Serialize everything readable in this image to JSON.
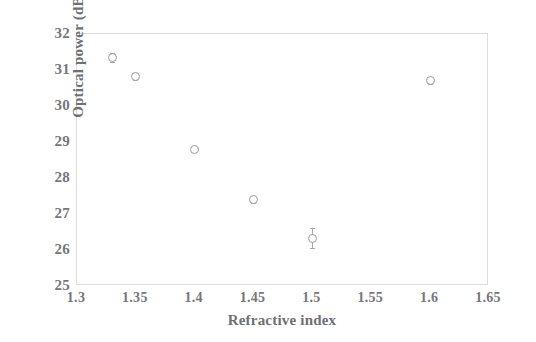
{
  "chart_data": {
    "type": "scatter",
    "title": "",
    "xlabel": "Refractive index",
    "ylabel": "Optical power (dB)",
    "xlim": [
      1.3,
      1.65
    ],
    "ylim": [
      25,
      32
    ],
    "grid": false,
    "legend": "none",
    "xticks": [
      "1.3",
      "1.35",
      "1.4",
      "1.45",
      "1.5",
      "1.55",
      "1.6",
      "1.65"
    ],
    "xtick_values": [
      1.3,
      1.35,
      1.4,
      1.45,
      1.5,
      1.55,
      1.6,
      1.65
    ],
    "yticks": [
      "32",
      "31",
      "30",
      "29",
      "28",
      "27",
      "26",
      "25"
    ],
    "ytick_values": [
      32,
      31,
      30,
      29,
      28,
      27,
      26,
      25
    ],
    "marker": "open-circle",
    "marker_color": "#9a9aa0",
    "x": [
      1.33,
      1.35,
      1.4,
      1.45,
      1.5,
      1.6
    ],
    "y": [
      31.35,
      30.82,
      28.8,
      27.4,
      26.33,
      30.7
    ],
    "yerr": [
      0.12,
      0.1,
      0.08,
      0.1,
      0.28,
      0.1
    ],
    "points": [
      {
        "x": 1.33,
        "y": 31.35,
        "yerr": 0.12
      },
      {
        "x": 1.35,
        "y": 30.82,
        "yerr": 0.1
      },
      {
        "x": 1.4,
        "y": 28.8,
        "yerr": 0.08
      },
      {
        "x": 1.45,
        "y": 27.4,
        "yerr": 0.1
      },
      {
        "x": 1.5,
        "y": 26.33,
        "yerr": 0.28
      },
      {
        "x": 1.6,
        "y": 30.7,
        "yerr": 0.1
      }
    ]
  },
  "style": {
    "background": "#ffffff",
    "axis_color": "#dcdcdf",
    "text_color": "#6f6f75",
    "marker_color": "#9a9aa0"
  }
}
